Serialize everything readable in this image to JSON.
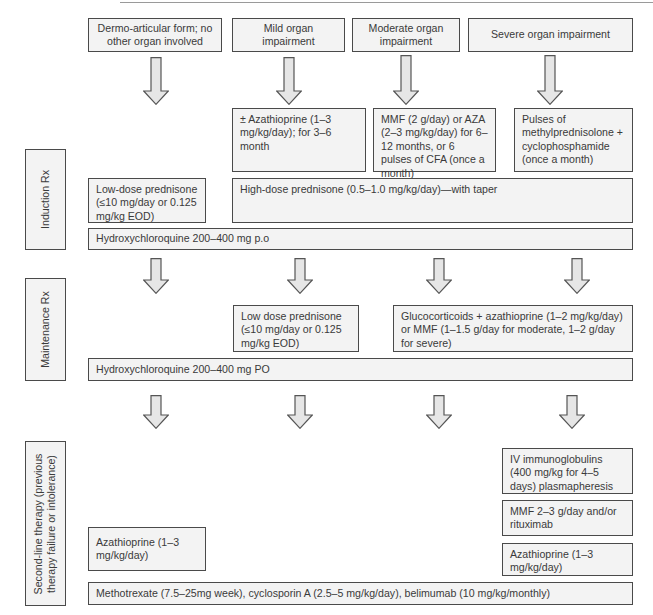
{
  "header": {
    "columns": [
      {
        "label": "Dermo-articular form; no other organ involved"
      },
      {
        "label": "Mild organ impairment"
      },
      {
        "label": "Moderate organ impairment"
      },
      {
        "label": "Severe organ impairment"
      }
    ]
  },
  "induction": {
    "section_label": "Induction Rx",
    "mild": "± Azathioprine (1–3 mg/kg/day); for 3–6 month",
    "moderate": "MMF (2 g/day) or AZA (2–3 mg/kg/day) for 6–12 months, or 6 pulses of CFA (once a month)",
    "severe": "Pulses of methylprednisolone + cyclophosphamide (once a month)",
    "low_dose": "Low-dose prednisone (≤10 mg/day or 0.125 mg/kg EOD)",
    "high_dose": "High-dose prednisone (0.5–1.0 mg/kg/day)—with taper",
    "hydroxy": "Hydroxychloroquine 200–400 mg p.o"
  },
  "maintenance": {
    "section_label": "Maintenance Rx",
    "low_dose": "Low dose prednisone (≤10 mg/day or 0.125 mg/kg EOD)",
    "gluco": "Glucocorticoids + azathioprine (1–2 mg/kg/day) or MMF (1–1.5 g/day for moderate, 1–2 g/day for severe)",
    "hydroxy": "Hydroxychloroquine 200–400 mg PO"
  },
  "second_line": {
    "section_label_line1": "Second-line therapy (previous",
    "section_label_line2": "therapy failure or intolerance)",
    "ivig": "IV immunoglobulins (400 mg/kg for 4–5 days) plasmapheresis",
    "mmf": "MMF 2–3 g/day and/or rituximab",
    "aza_right": "Azathioprine (1–3 mg/kg/day)",
    "aza_left": "Azathioprine (1–3 mg/kg/day)",
    "methotrexate": "Methotrexate (7.5–25mg week), cyclosporin A (2.5–5 mg/kg/day), belimumab (10 mg/kg/monthly)"
  },
  "colors": {
    "box_fill": "#f3f3f3",
    "box_border": "#4a4a4a",
    "arrow_fill": "#e6e6e6",
    "text": "#3a3a3a"
  }
}
